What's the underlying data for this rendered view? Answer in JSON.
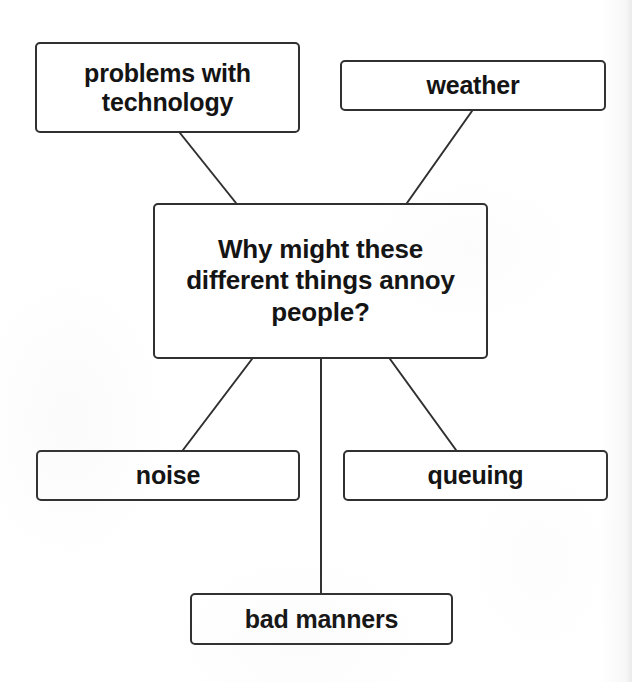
{
  "diagram": {
    "type": "mind-map",
    "background_color": "#ffffff",
    "line_color": "#303030",
    "text_color": "#141414",
    "center": {
      "id": "center",
      "label": "Why might these\ndifferent things annoy\npeople?"
    },
    "nodes": [
      {
        "id": "technology",
        "label": "problems with\ntechnology"
      },
      {
        "id": "weather",
        "label": "weather"
      },
      {
        "id": "noise",
        "label": "noise"
      },
      {
        "id": "queuing",
        "label": "queuing"
      },
      {
        "id": "bad_manners",
        "label": "bad manners"
      }
    ],
    "edges": [
      {
        "from": "technology",
        "to": "center"
      },
      {
        "from": "weather",
        "to": "center"
      },
      {
        "from": "center",
        "to": "noise"
      },
      {
        "from": "center",
        "to": "queuing"
      },
      {
        "from": "center",
        "to": "bad_manners"
      }
    ]
  }
}
